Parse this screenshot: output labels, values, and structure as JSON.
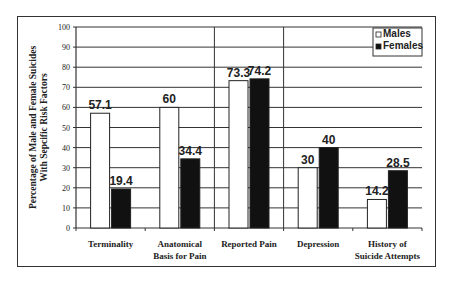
{
  "chart_data": {
    "type": "bar",
    "title": "",
    "xlabel": "",
    "ylabel": "Percentage of Male and Female Suicides With Sepcific Risk Factors",
    "ylabel_lines": [
      "Percentage of Male and Female Suicides",
      "With Sepcific Risk Factors"
    ],
    "ylim": [
      0,
      100
    ],
    "yticks": [
      0,
      10,
      20,
      30,
      40,
      50,
      60,
      70,
      80,
      90,
      100
    ],
    "grid": true,
    "legend_position": "top-right",
    "categories": [
      "Terminality",
      "Anatomical Basis for Pain",
      "Reported Pain",
      "Depression",
      "History of Suicide Attempts"
    ],
    "category_lines": [
      [
        "Terminality"
      ],
      [
        "Anatomical",
        "Basis for Pain"
      ],
      [
        "Reported Pain"
      ],
      [
        "Depression"
      ],
      [
        "History of",
        "Suicide Attempts"
      ]
    ],
    "series": [
      {
        "name": "Males",
        "color": "#ffffff",
        "values": [
          57.1,
          60,
          73.3,
          30,
          14.2
        ],
        "labels": [
          "57.1",
          "60",
          "73.3",
          "30",
          "14.2"
        ]
      },
      {
        "name": "Females",
        "color": "#111111",
        "values": [
          19.4,
          34.4,
          74.2,
          40,
          28.5
        ],
        "labels": [
          "19.4",
          "34.4",
          "74.2",
          "40",
          "28.5"
        ]
      }
    ]
  }
}
